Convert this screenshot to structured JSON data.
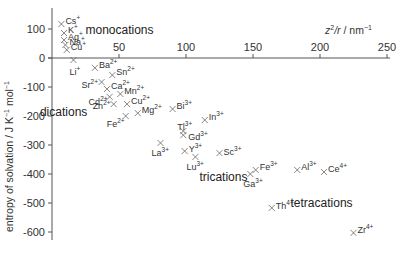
{
  "chart_data": {
    "type": "scatter",
    "title": "",
    "xlabel": "z²/r / nm⁻¹",
    "ylabel": "entropy of solvation / J K⁻¹ mol⁻¹",
    "xlim": [
      0,
      250
    ],
    "ylim": [
      -620,
      130
    ],
    "x_ticks": [
      50,
      100,
      150,
      200,
      250
    ],
    "y_ticks": [
      100,
      0,
      -100,
      -200,
      -300,
      -400,
      -500,
      -600
    ],
    "grid": false,
    "legend": null,
    "marker": "x",
    "group_labels": [
      {
        "text": "monocations",
        "x": 25,
        "y": 82
      },
      {
        "text": "dications",
        "x": -9,
        "y": -200
      },
      {
        "text": "trications",
        "x": 110,
        "y": -425
      },
      {
        "text": "tetracations",
        "x": 178,
        "y": -515
      }
    ],
    "points": [
      {
        "ion": "Cs",
        "charge": "+",
        "x": 7,
        "y": 117
      },
      {
        "ion": "K",
        "charge": "+",
        "x": 9,
        "y": 86
      },
      {
        "ion": "Ag",
        "charge": "+",
        "x": 9,
        "y": 62
      },
      {
        "ion": "Na",
        "charge": "+",
        "x": 10,
        "y": 45
      },
      {
        "ion": "Cu",
        "charge": "+",
        "x": 11,
        "y": 28
      },
      {
        "ion": "Li",
        "charge": "+",
        "x": 16,
        "y": -7
      },
      {
        "ion": "Ba",
        "charge": "2+",
        "x": 32,
        "y": -34
      },
      {
        "ion": "Sn",
        "charge": "2+",
        "x": 45,
        "y": -59
      },
      {
        "ion": "Sr",
        "charge": "2+",
        "x": 37,
        "y": -83
      },
      {
        "ion": "Ca",
        "charge": "2+",
        "x": 41,
        "y": -107
      },
      {
        "ion": "Mn",
        "charge": "2+",
        "x": 51,
        "y": -124
      },
      {
        "ion": "Cd",
        "charge": "2+",
        "x": 43,
        "y": -134
      },
      {
        "ion": "Zn",
        "charge": "2+",
        "x": 46,
        "y": -159
      },
      {
        "ion": "Cu",
        "charge": "2+",
        "x": 56,
        "y": -159
      },
      {
        "ion": "Mg",
        "charge": "2+",
        "x": 64,
        "y": -190
      },
      {
        "ion": "Fe",
        "charge": "2+",
        "x": 55,
        "y": -200
      },
      {
        "ion": "Bi",
        "charge": "3+",
        "x": 90,
        "y": -176
      },
      {
        "ion": "In",
        "charge": "3+",
        "x": 114,
        "y": -214
      },
      {
        "ion": "Tl",
        "charge": "3+",
        "x": 98,
        "y": -252
      },
      {
        "ion": "Gd",
        "charge": "3+",
        "x": 98,
        "y": -266
      },
      {
        "ion": "La",
        "charge": "3+",
        "x": 81,
        "y": -293
      },
      {
        "ion": "Y",
        "charge": "3+",
        "x": 99,
        "y": -321
      },
      {
        "ion": "Lu",
        "charge": "3+",
        "x": 107,
        "y": -341
      },
      {
        "ion": "Sc",
        "charge": "3+",
        "x": 125,
        "y": -328
      },
      {
        "ion": "Ga",
        "charge": "3+",
        "x": 148,
        "y": -400
      },
      {
        "ion": "Fe",
        "charge": "3+",
        "x": 152,
        "y": -386
      },
      {
        "ion": "Al",
        "charge": "3+",
        "x": 183,
        "y": -386
      },
      {
        "ion": "Ce",
        "charge": "4+",
        "x": 203,
        "y": -393
      },
      {
        "ion": "Th",
        "charge": "4+",
        "x": 164,
        "y": -517
      },
      {
        "ion": "Zr",
        "charge": "4+",
        "x": 225,
        "y": -603
      }
    ]
  },
  "layout": {
    "origin_px": [
      52,
      58
    ],
    "px_per_x_unit": 1.34,
    "px_per_y_unit": 0.29,
    "axis_color": "#555555",
    "marker_color": "#666666"
  },
  "label_offsets": {
    "Cs+": [
      4,
      -3
    ],
    "K+": [
      4,
      -3
    ],
    "Ag+": [
      4,
      -3
    ],
    "Na+": [
      4,
      -3
    ],
    "Cu+": [
      4,
      -3
    ],
    "Li+": [
      -4,
      12
    ],
    "Ba2+": [
      4,
      -3
    ],
    "Sn2+": [
      4,
      -3
    ],
    "Sr2+": [
      -20,
      3
    ],
    "Ca2+": [
      4,
      -3
    ],
    "Mn2+": [
      4,
      -3
    ],
    "Cd2+": [
      -21,
      5
    ],
    "Zn2+": [
      -21,
      2
    ],
    "Cu2+": [
      4,
      -3
    ],
    "Mg2+": [
      4,
      -3
    ],
    "Fe2+": [
      -19,
      8
    ],
    "Bi3+": [
      4,
      -3
    ],
    "In3+": [
      4,
      -3
    ],
    "Tl3+": [
      -6,
      -4
    ],
    "Gd3+": [
      5,
      2
    ],
    "La3+": [
      -9,
      10
    ],
    "Y3+": [
      4,
      -2
    ],
    "Lu3+": [
      -9,
      10
    ],
    "Sc3+": [
      4,
      -1
    ],
    "Ga3+": [
      -7,
      10
    ],
    "Fe3+": [
      4,
      -3
    ],
    "Al3+": [
      4,
      -3
    ],
    "Ce4+": [
      4,
      -3
    ],
    "Th4+": [
      4,
      -2
    ],
    "Zr4+": [
      4,
      -3
    ]
  }
}
